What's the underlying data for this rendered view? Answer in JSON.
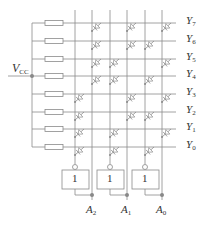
{
  "diagram": {
    "colors": {
      "line": "#8a8a8a",
      "diode": "#8a8a8a",
      "dot": "#888888",
      "text": "#333333"
    },
    "supply": {
      "label": "V",
      "sub": "CC"
    },
    "outputs": [
      {
        "label": "Y",
        "sub": "7",
        "y": 23
      },
      {
        "label": "Y",
        "sub": "6",
        "y": 41
      },
      {
        "label": "Y",
        "sub": "5",
        "y": 59
      },
      {
        "label": "Y",
        "sub": "4",
        "y": 76
      },
      {
        "label": "Y",
        "sub": "3",
        "y": 94
      },
      {
        "label": "Y",
        "sub": "2",
        "y": 112
      },
      {
        "label": "Y",
        "sub": "1",
        "y": 129
      },
      {
        "label": "Y",
        "sub": "0",
        "y": 147
      }
    ],
    "inputs": [
      {
        "label": "A",
        "sub": "2",
        "inv_x": 75,
        "true_x": 92,
        "buffer_label": "1"
      },
      {
        "label": "A",
        "sub": "1",
        "inv_x": 110,
        "true_x": 127,
        "buffer_label": "1"
      },
      {
        "label": "A",
        "sub": "0",
        "inv_x": 145,
        "true_x": 162,
        "buffer_label": "1"
      }
    ],
    "columns": [
      {
        "x": 75,
        "signal": "A2'",
        "diode_rows": [
          "Y3",
          "Y2",
          "Y1",
          "Y0"
        ]
      },
      {
        "x": 92,
        "signal": "A2",
        "diode_rows": [
          "Y7",
          "Y6",
          "Y5",
          "Y4"
        ]
      },
      {
        "x": 110,
        "signal": "A1'",
        "diode_rows": [
          "Y5",
          "Y4",
          "Y1",
          "Y0"
        ]
      },
      {
        "x": 127,
        "signal": "A1",
        "diode_rows": [
          "Y7",
          "Y6",
          "Y3",
          "Y2"
        ]
      },
      {
        "x": 145,
        "signal": "A0'",
        "diode_rows": [
          "Y6",
          "Y4",
          "Y2",
          "Y0"
        ]
      },
      {
        "x": 162,
        "signal": "A0",
        "diode_rows": [
          "Y7",
          "Y5",
          "Y3",
          "Y1"
        ]
      }
    ]
  }
}
